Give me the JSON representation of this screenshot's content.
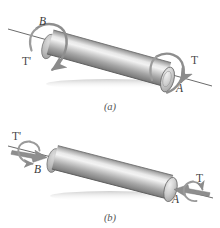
{
  "figure": {
    "background_color": "#ffffff",
    "panels": [
      {
        "id": "a",
        "caption": "(a)",
        "labels": {
          "end_near": "A",
          "end_far": "B",
          "torque": "T",
          "reaction_torque": "T'"
        },
        "arrow_style": "curved-rotation-arrows",
        "axis_line": "dashed-through-axis"
      },
      {
        "id": "b",
        "caption": "(b)",
        "labels": {
          "end_near": "A",
          "end_far": "B",
          "torque": "T",
          "reaction_torque": "T'"
        },
        "arrow_style": "block-vector-arrows-with-small-rotation-loops",
        "axis_line": "solid-through-axis"
      }
    ],
    "colors": {
      "cylinder_dark": "#7d7d7d",
      "cylinder_mid": "#a8a8a8",
      "cylinder_highlight": "#efefef",
      "cylinder_shadow": "#6e6e6e",
      "end_face": "#c9c9c9",
      "arrow_gray": "#8e8e8e",
      "axis_line": "#555555",
      "label_text": "#3a3a3a"
    }
  }
}
